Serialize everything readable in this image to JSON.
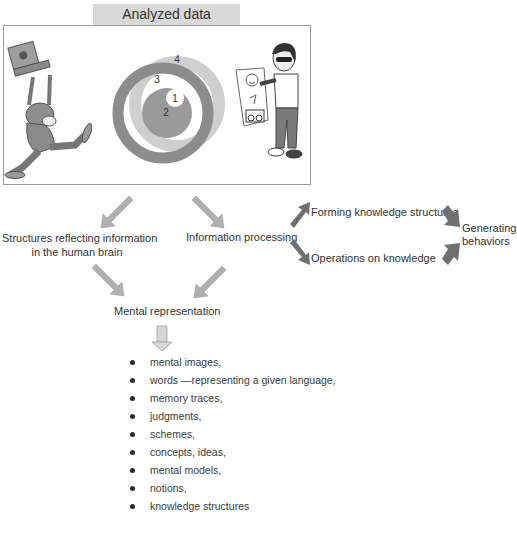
{
  "header": {
    "title": "Analyzed data"
  },
  "illustration": {
    "circles": [
      {
        "id": "1",
        "label": "1",
        "fill": "#ffffff"
      },
      {
        "id": "2",
        "label": "2",
        "fill": "#9a9a9a"
      },
      {
        "id": "3",
        "label": "3",
        "fill": "#8c8c8c"
      },
      {
        "id": "4",
        "label": "4",
        "fill": "#cfcfcf"
      }
    ],
    "left_figure": "person-running-with-laptop",
    "right_figure": "person-holding-picture-card"
  },
  "flow": {
    "structures": {
      "line1": "Structures reflecting information",
      "line2": "in the human brain"
    },
    "processing": "Information processing",
    "forming": "Forming knowledge structures",
    "operations": "Operations on knowledge",
    "generating": {
      "line1": "Generating",
      "line2": "behaviors"
    },
    "mental_representation": "Mental representation"
  },
  "list": {
    "items": [
      "mental images,",
      "words —representing a given language,",
      "memory traces,",
      "judgments,",
      "schemes,",
      "concepts, ideas,",
      "mental models,",
      "notions,",
      "knowledge structures"
    ]
  },
  "colors": {
    "arrow_light": "#b0b0b0",
    "arrow_dark": "#6f6f6f",
    "title_bg": "#d9d9d9",
    "frame_border": "#9a9a9a"
  }
}
